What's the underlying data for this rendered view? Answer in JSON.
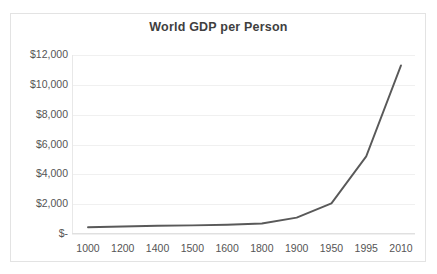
{
  "chart_data": {
    "type": "line",
    "title": "World GDP per Person",
    "xlabel": "",
    "ylabel": "",
    "categories": [
      "1000",
      "1200",
      "1400",
      "1500",
      "1600",
      "1800",
      "1900",
      "1950",
      "1995",
      "2010"
    ],
    "values": [
      450,
      500,
      550,
      580,
      620,
      700,
      1100,
      2050,
      5200,
      11300
    ],
    "series": [
      {
        "name": "World GDP per Person",
        "values": [
          450,
          500,
          550,
          580,
          620,
          700,
          1100,
          2050,
          5200,
          11300
        ]
      }
    ],
    "ylim": [
      0,
      12000
    ],
    "ytick_values": [
      12000,
      10000,
      8000,
      6000,
      4000,
      2000,
      0
    ],
    "ytick_labels": [
      "$12,000",
      "$10,000",
      "$8,000",
      "$6,000",
      "$4,000",
      "$2,000",
      "$-"
    ],
    "xtick_labels": [
      "1000",
      "1200",
      "1400",
      "1500",
      "1600",
      "1800",
      "1900",
      "1950",
      "1995",
      "2010"
    ],
    "grid": true,
    "grid_axis": "y",
    "legend": false,
    "legend_position": "none",
    "line_color": "#595959",
    "grid_color": "#f0f0f0",
    "text_color": "#555555",
    "title_color": "#3f3f3f",
    "background_color": "#ffffff",
    "border_color": "#e3e3e3",
    "annotations": []
  }
}
